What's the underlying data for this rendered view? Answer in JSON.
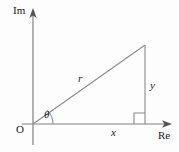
{
  "figure": {
    "background_color": "#fdfdfd",
    "line_color": "#808080",
    "text_color": "#1a1a1a"
  },
  "axes": {
    "imaginary": {
      "label": "Im",
      "orientation": "vertical",
      "arrow": "up",
      "x": 33,
      "y_top": 10,
      "y_bottom": 145
    },
    "real": {
      "label": "Re",
      "orientation": "horizontal",
      "arrow": "right",
      "y": 124,
      "x_left": 22,
      "x_right": 172
    },
    "origin_label": "O"
  },
  "triangle": {
    "origin": {
      "x": 33,
      "y": 124
    },
    "apex": {
      "x": 145,
      "y": 45
    },
    "foot": {
      "x": 145,
      "y": 124
    },
    "hypotenuse_label": "r",
    "adjacent_label": "x",
    "opposite_label": "y",
    "angle_label": "θ",
    "right_angle_marker": true,
    "right_angle_size": 11,
    "angle_arc_radius": 20
  },
  "labels": {
    "im": "Im",
    "re": "Re",
    "origin": "O",
    "theta": "θ",
    "r": "r",
    "x": "x",
    "y": "y"
  }
}
